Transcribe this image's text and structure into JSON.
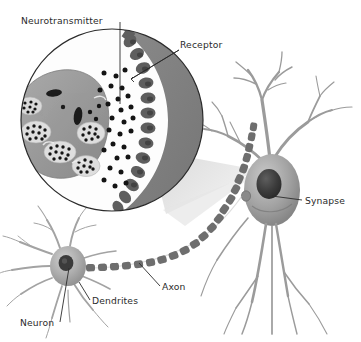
{
  "figure": {
    "background_color": "#ffffff"
  },
  "labels": {
    "neurotransmitter": "Neurotransmitter",
    "receptor": "Receptor",
    "synapse": "Synapse",
    "axon": "Axon",
    "dendrites": "Dendrites",
    "neuron": "Neuron"
  },
  "colors": {
    "outline": "#2b2b2b",
    "label_text": "#2b2b2b",
    "presynaptic_terminal": "#9a9a9a",
    "postsynaptic_membrane": "#7e7e7e",
    "vesicle_cluster": "#d8d8d8",
    "vesicle_dot": "#1a1a1a",
    "mitochondrion": "#1c1c1c",
    "neurotransmitter_dot": "#141414",
    "magnifier_circle_fill": "#fdfdfd",
    "magnifier_cone": "#dcdcdc",
    "neuron_body": "#8e8e8e",
    "neuron_nucleus": "#3a3a3a",
    "dendrite_stroke": "#9d9d9d",
    "myelin_segment": "#6e6e6e",
    "small_neuron_body": "#a5a5a5"
  },
  "parts": {
    "magnifier": {
      "name": "magnified-synapse-circle",
      "center_x": 112,
      "center_y": 120,
      "radius": 92
    },
    "large_neuron": {
      "name": "postsynaptic-neuron",
      "soma_center_x": 272,
      "soma_center_y": 190,
      "dendrite_count": 5
    },
    "small_neuron": {
      "name": "presynaptic-neuron",
      "soma_center_x": 68,
      "soma_center_y": 266,
      "dendrite_count": 10
    },
    "axon": {
      "name": "myelinated-axon",
      "segment_count": 22
    }
  },
  "leaders": [
    {
      "label": "neurotransmitter",
      "from_x": 120,
      "from_y": 22,
      "to_x": 120,
      "to_y": 104
    },
    {
      "label": "receptor",
      "from_x": 179,
      "from_y": 50,
      "to_x": 131,
      "to_y": 79
    },
    {
      "label": "synapse",
      "from_x": 300,
      "from_y": 200,
      "to_x": 272,
      "to_y": 195
    },
    {
      "label": "axon",
      "from_x": 160,
      "from_y": 285,
      "to_x": 139,
      "to_y": 263
    },
    {
      "label": "dendrites",
      "from_x": 90,
      "from_y": 300,
      "to_x": 79,
      "to_y": 282
    },
    {
      "label": "neuron",
      "from_x": 60,
      "from_y": 320,
      "to_x": 69,
      "to_y": 266
    }
  ]
}
